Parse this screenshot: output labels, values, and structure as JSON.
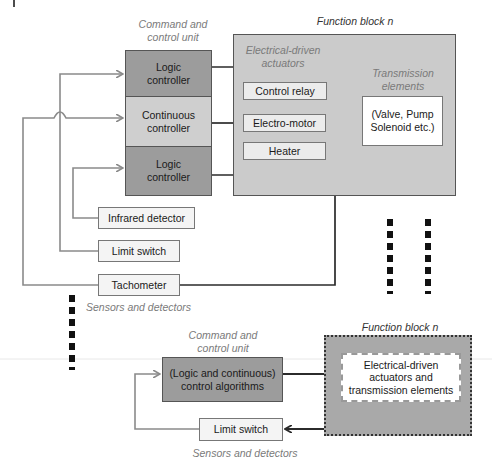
{
  "colors": {
    "dark_block": "#9c9c9c",
    "light_block": "#cfcfcf",
    "function_block": "#cbcbcb",
    "function_block_bottom": "#a9a9a9",
    "sub_box": "#ececec",
    "white_box": "#ffffff",
    "gray_line": "#8a8a8a",
    "black_line": "#2b2b2b",
    "caption": "#7a7a7a"
  },
  "top": {
    "command_unit_caption": [
      "Command and",
      "control unit"
    ],
    "controllers": [
      {
        "label": [
          "Logic",
          "controller"
        ],
        "shade": "dark"
      },
      {
        "label": [
          "Continuous",
          "controller"
        ],
        "shade": "light"
      },
      {
        "label": [
          "Logic",
          "controller"
        ],
        "shade": "dark"
      }
    ],
    "function_block_title": "Function block n",
    "actuators_caption": [
      "Electrical-driven",
      "actuators"
    ],
    "actuators": [
      "Control relay",
      "Electro-motor",
      "Heater"
    ],
    "transmission_caption": [
      "Transmission",
      "elements"
    ],
    "transmission_box": [
      "(Valve, Pump",
      "Solenoid etc.)"
    ],
    "sensors": [
      "Infrared detector",
      "Limit switch",
      "Tachometer"
    ],
    "sensors_caption": "Sensors and detectors"
  },
  "bottom": {
    "command_unit_caption": [
      "Command and",
      "control unit"
    ],
    "control_box": [
      "(Logic and continuous)",
      "control algorithms"
    ],
    "function_block_title": "Function block n",
    "inner_box": [
      "Electrical-driven",
      "actuators and",
      "transmission elements"
    ],
    "sensor": "Limit switch",
    "sensors_caption": "Sensors and detectors"
  }
}
